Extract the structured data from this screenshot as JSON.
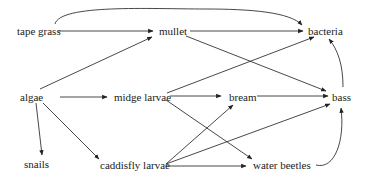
{
  "diagram": {
    "type": "food-web",
    "nodes": [
      {
        "id": "tape_grass",
        "label": "tape grass"
      },
      {
        "id": "mullet",
        "label": "mullet"
      },
      {
        "id": "bacteria",
        "label": "bacteria"
      },
      {
        "id": "algae",
        "label": "algae"
      },
      {
        "id": "midge_larvae",
        "label": "midge larvae"
      },
      {
        "id": "bream",
        "label": "bream"
      },
      {
        "id": "bass",
        "label": "bass"
      },
      {
        "id": "snails",
        "label": "snails"
      },
      {
        "id": "caddisfly_larvae",
        "label": "caddisfly larvae"
      },
      {
        "id": "water_beetles",
        "label": "water beetles"
      }
    ],
    "edges": [
      {
        "from": "tape grass",
        "to": "mullet"
      },
      {
        "from": "tape grass",
        "to": "bacteria"
      },
      {
        "from": "mullet",
        "to": "bacteria"
      },
      {
        "from": "mullet",
        "to": "bass"
      },
      {
        "from": "algae",
        "to": "mullet"
      },
      {
        "from": "algae",
        "to": "midge larvae"
      },
      {
        "from": "algae",
        "to": "snails"
      },
      {
        "from": "algae",
        "to": "caddisfly larvae"
      },
      {
        "from": "midge larvae",
        "to": "bacteria"
      },
      {
        "from": "midge larvae",
        "to": "bream"
      },
      {
        "from": "midge larvae",
        "to": "water beetles"
      },
      {
        "from": "caddisfly larvae",
        "to": "bream"
      },
      {
        "from": "caddisfly larvae",
        "to": "bass"
      },
      {
        "from": "caddisfly larvae",
        "to": "water beetles"
      },
      {
        "from": "bream",
        "to": "bass"
      },
      {
        "from": "bass",
        "to": "bacteria"
      },
      {
        "from": "water beetles",
        "to": "bass"
      }
    ],
    "colors": {
      "line": "#333333",
      "text": "#222222",
      "background": "#ffffff"
    }
  }
}
